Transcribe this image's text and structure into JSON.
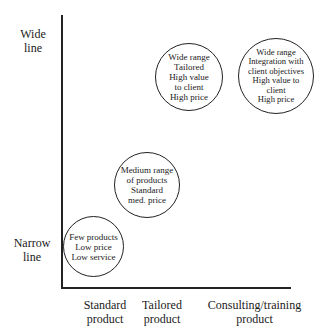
{
  "diagram": {
    "y_axis": {
      "top_label": [
        "Wide",
        "line"
      ],
      "bottom_label": [
        "Narrow",
        "line"
      ]
    },
    "x_axis": {
      "labels": [
        [
          "Standard",
          "product"
        ],
        [
          "Tailored",
          "product"
        ],
        [
          "Consulting/training",
          "product"
        ]
      ]
    },
    "circles": [
      {
        "lines": [
          "Few products",
          "Low price",
          "Low service"
        ]
      },
      {
        "lines": [
          "Medium range",
          "of products",
          "Standard",
          "med. price"
        ]
      },
      {
        "lines": [
          "Wide range",
          "Tailored",
          "High value",
          "to client",
          "High price"
        ]
      },
      {
        "lines": [
          "Wide range",
          "Integration with",
          "client objectives",
          "High value to",
          "client",
          "High price"
        ]
      }
    ]
  }
}
